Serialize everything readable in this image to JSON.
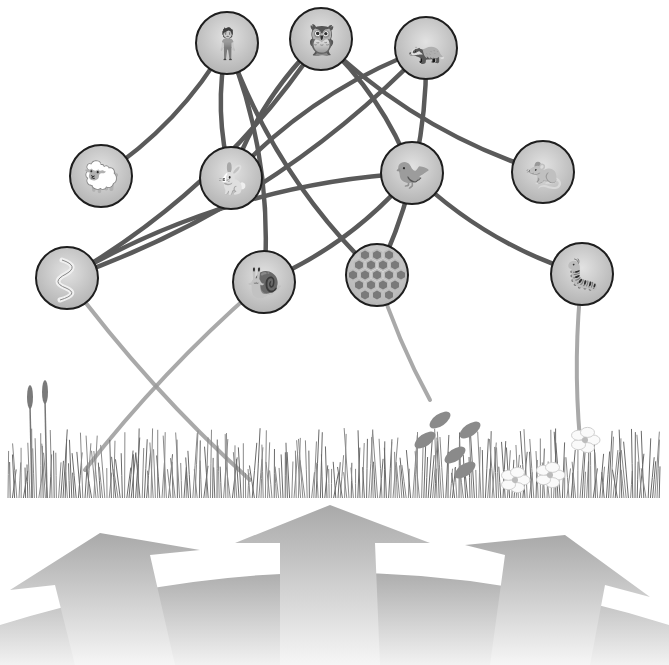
{
  "diagram": {
    "type": "food-web",
    "organisms": [
      {
        "id": "human",
        "label": "Human",
        "icon": "human-icon",
        "level": "top"
      },
      {
        "id": "owl",
        "label": "Owl",
        "icon": "owl-icon",
        "level": "top"
      },
      {
        "id": "badger",
        "label": "Badger",
        "icon": "badger-icon",
        "level": "top"
      },
      {
        "id": "sheep",
        "label": "Sheep",
        "icon": "sheep-icon",
        "level": "middle"
      },
      {
        "id": "rabbit",
        "label": "Rabbit",
        "icon": "rabbit-icon",
        "level": "middle"
      },
      {
        "id": "bird",
        "label": "Songbird",
        "icon": "bird-icon",
        "level": "middle"
      },
      {
        "id": "shrew",
        "label": "Shrew",
        "icon": "shrew-icon",
        "level": "middle"
      },
      {
        "id": "worm",
        "label": "Earthworm",
        "icon": "worm-icon",
        "level": "lower"
      },
      {
        "id": "snail",
        "label": "Snail",
        "icon": "snail-icon",
        "level": "lower"
      },
      {
        "id": "honeycomb",
        "label": "Bees / Honeycomb",
        "icon": "honeycomb-icon",
        "level": "lower"
      },
      {
        "id": "caterpillar",
        "label": "Caterpillar",
        "icon": "caterpillar-icon",
        "level": "lower"
      }
    ],
    "links": [
      [
        "human",
        "sheep"
      ],
      [
        "human",
        "rabbit"
      ],
      [
        "human",
        "snail"
      ],
      [
        "human",
        "honeycomb"
      ],
      [
        "owl",
        "worm"
      ],
      [
        "owl",
        "rabbit"
      ],
      [
        "owl",
        "bird"
      ],
      [
        "owl",
        "shrew"
      ],
      [
        "badger",
        "worm"
      ],
      [
        "badger",
        "rabbit"
      ],
      [
        "badger",
        "honeycomb"
      ],
      [
        "bird",
        "worm"
      ],
      [
        "bird",
        "snail"
      ],
      [
        "bird",
        "caterpillar"
      ]
    ],
    "plant_links": [
      [
        "worm",
        "grass-right"
      ],
      [
        "snail",
        "grass-left"
      ],
      [
        "honeycomb",
        "flowers"
      ],
      [
        "caterpillar",
        "nettle"
      ]
    ],
    "ground": {
      "label": "Grassland plants",
      "items": [
        "grass",
        "reeds",
        "nettle",
        "wild flowers"
      ]
    },
    "energy_arrows": {
      "count": 4,
      "label": "Sun energy"
    },
    "colors": {
      "link": "#5a5a5a",
      "plant_link": "#9a9a9a",
      "node_fill": "#c8c8c8",
      "node_stroke": "#1e1e1e",
      "arrow_light": "#f4f4f4",
      "arrow_dark": "#a8a8a8"
    }
  }
}
